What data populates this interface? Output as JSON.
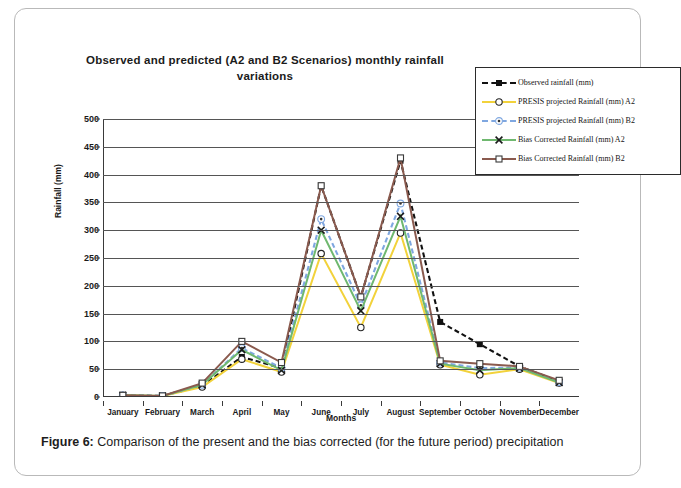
{
  "figure": {
    "caption_label": "Figure 6:",
    "caption_text": " Comparison of the present and the bias corrected (for the future period) precipitation"
  },
  "chart_data": {
    "type": "line",
    "title": "Observed and predicted (A2 and B2 Scenarios) monthly rainfall variations",
    "xlabel": "Months",
    "ylabel": "Rainfall (mm)",
    "ylim": [
      0,
      500
    ],
    "ytick_step": 50,
    "grid": true,
    "legend_position": "top-right",
    "categories": [
      "January",
      "February",
      "March",
      "April",
      "May",
      "June",
      "July",
      "August",
      "September",
      "October",
      "November",
      "December"
    ],
    "ytick_labels": [
      "500",
      "450",
      "400",
      "350",
      "300",
      "250",
      "200",
      "150",
      "100",
      "50",
      "0"
    ],
    "series": [
      {
        "name": "Observed rainfall (mm)",
        "color": "#111111",
        "dash": "dashed",
        "marker": "filled-square",
        "values": [
          3,
          2,
          20,
          72,
          52,
          380,
          180,
          425,
          135,
          95,
          55,
          28
        ]
      },
      {
        "name": "PRESIS projected Rainfall (mm) A2",
        "color": "#f2d23b",
        "dash": "solid",
        "marker": "open-circle",
        "values": [
          3,
          2,
          18,
          68,
          45,
          258,
          125,
          295,
          58,
          40,
          50,
          25
        ]
      },
      {
        "name": "PRESIS projected Rainfall (mm) B2",
        "color": "#7fa7e0",
        "dash": "dashed",
        "marker": "circled-dot",
        "values": [
          3,
          2,
          22,
          88,
          52,
          320,
          165,
          348,
          62,
          52,
          53,
          27
        ]
      },
      {
        "name": "Bias Corrected Rainfall (mm) A2",
        "color": "#6fb86f",
        "dash": "solid",
        "marker": "x-cross",
        "values": [
          3,
          2,
          22,
          85,
          48,
          300,
          155,
          325,
          60,
          48,
          52,
          26
        ]
      },
      {
        "name": "Bias Corrected Rainfall (mm) B2",
        "color": "#8a5a4e",
        "dash": "solid",
        "marker": "open-square",
        "values": [
          3,
          2,
          25,
          100,
          62,
          380,
          180,
          430,
          65,
          60,
          55,
          30
        ]
      }
    ]
  }
}
